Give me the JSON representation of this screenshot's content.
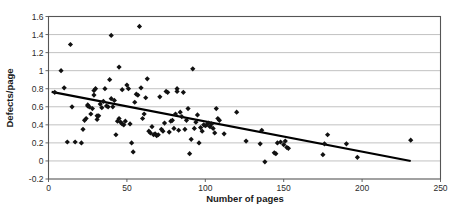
{
  "chart_data": {
    "type": "scatter",
    "title": "",
    "subtitle": "",
    "xlabel": "Number of pages",
    "ylabel": "Defects/page",
    "xlim": [
      0,
      250
    ],
    "ylim": [
      -0.2,
      1.6
    ],
    "xticks": [
      0,
      50,
      100,
      150,
      200,
      250
    ],
    "xtick_labels": [
      "0",
      "50",
      "100",
      "150",
      "200",
      "250"
    ],
    "yticks": [
      -0.2,
      0,
      0.2,
      0.4,
      0.6,
      0.8,
      1,
      1.2,
      1.4,
      1.6
    ],
    "ytick_labels": [
      "-0.2",
      "0",
      "0.2",
      "0.4",
      "0.6",
      "0.8",
      "1",
      "1.2",
      "1.4",
      "1.6"
    ],
    "grid": "horizontal",
    "legend": "none",
    "marker": "diamond",
    "marker_color": "#111111",
    "points": [
      [
        4,
        0.76
      ],
      [
        8,
        1.0
      ],
      [
        10,
        0.81
      ],
      [
        12,
        0.21
      ],
      [
        14,
        1.29
      ],
      [
        15,
        0.6
      ],
      [
        17,
        0.21
      ],
      [
        21,
        0.2
      ],
      [
        22,
        0.35
      ],
      [
        23,
        0.45
      ],
      [
        24,
        0.47
      ],
      [
        25,
        0.62
      ],
      [
        25,
        0.61
      ],
      [
        26,
        0.6
      ],
      [
        27,
        0.52
      ],
      [
        28,
        0.58
      ],
      [
        29,
        0.73
      ],
      [
        29,
        0.78
      ],
      [
        30,
        0.8
      ],
      [
        31,
        0.5
      ],
      [
        31,
        0.46
      ],
      [
        32,
        0.5
      ],
      [
        33,
        0.63
      ],
      [
        34,
        0.59
      ],
      [
        35,
        0.66
      ],
      [
        36,
        0.8
      ],
      [
        37,
        0.61
      ],
      [
        38,
        0.6
      ],
      [
        39,
        0.9
      ],
      [
        40,
        1.39
      ],
      [
        40,
        0.69
      ],
      [
        41,
        0.6
      ],
      [
        42,
        0.67
      ],
      [
        43,
        0.29
      ],
      [
        44,
        0.44
      ],
      [
        45,
        1.04
      ],
      [
        45,
        0.47
      ],
      [
        46,
        0.43
      ],
      [
        47,
        0.79
      ],
      [
        47,
        0.41
      ],
      [
        48,
        0.4
      ],
      [
        49,
        0.44
      ],
      [
        50,
        0.84
      ],
      [
        51,
        0.8
      ],
      [
        52,
        0.41
      ],
      [
        53,
        0.2
      ],
      [
        54,
        0.1
      ],
      [
        55,
        0.65
      ],
      [
        56,
        0.74
      ],
      [
        57,
        0.73
      ],
      [
        58,
        1.49
      ],
      [
        59,
        0.81
      ],
      [
        60,
        0.47
      ],
      [
        61,
        0.52
      ],
      [
        62,
        0.7
      ],
      [
        63,
        0.91
      ],
      [
        64,
        0.33
      ],
      [
        65,
        0.31
      ],
      [
        66,
        0.38
      ],
      [
        67,
        0.29
      ],
      [
        68,
        0.3
      ],
      [
        69,
        0.28
      ],
      [
        70,
        0.29
      ],
      [
        71,
        0.71
      ],
      [
        72,
        0.35
      ],
      [
        73,
        0.33
      ],
      [
        74,
        0.42
      ],
      [
        75,
        0.77
      ],
      [
        76,
        0.76
      ],
      [
        77,
        0.32
      ],
      [
        78,
        0.44
      ],
      [
        79,
        0.45
      ],
      [
        80,
        0.36
      ],
      [
        81,
        0.52
      ],
      [
        82,
        0.8
      ],
      [
        82,
        0.77
      ],
      [
        83,
        0.34
      ],
      [
        84,
        0.54
      ],
      [
        85,
        0.49
      ],
      [
        86,
        0.76
      ],
      [
        87,
        0.35
      ],
      [
        88,
        0.45
      ],
      [
        89,
        0.58
      ],
      [
        90,
        0.08
      ],
      [
        91,
        0.24
      ],
      [
        92,
        1.02
      ],
      [
        93,
        0.36
      ],
      [
        94,
        0.43
      ],
      [
        95,
        0.51
      ],
      [
        96,
        0.2
      ],
      [
        97,
        0.37
      ],
      [
        98,
        0.33
      ],
      [
        99,
        0.4
      ],
      [
        100,
        0.39
      ],
      [
        101,
        0.4
      ],
      [
        102,
        0.42
      ],
      [
        103,
        0.38
      ],
      [
        104,
        0.41
      ],
      [
        105,
        0.36
      ],
      [
        106,
        0.31
      ],
      [
        107,
        0.58
      ],
      [
        108,
        0.47
      ],
      [
        109,
        0.45
      ],
      [
        112,
        0.3
      ],
      [
        120,
        0.54
      ],
      [
        126,
        0.22
      ],
      [
        135,
        0.19
      ],
      [
        136,
        0.34
      ],
      [
        138,
        -0.01
      ],
      [
        144,
        0.09
      ],
      [
        145,
        0.08
      ],
      [
        146,
        0.2
      ],
      [
        148,
        0.21
      ],
      [
        150,
        0.18
      ],
      [
        151,
        0.22
      ],
      [
        152,
        0.15
      ],
      [
        153,
        0.14
      ],
      [
        175,
        0.07
      ],
      [
        176,
        0.19
      ],
      [
        178,
        0.29
      ],
      [
        190,
        0.19
      ],
      [
        197,
        0.04
      ],
      [
        231,
        0.23
      ]
    ],
    "trendline": {
      "type": "linear",
      "x_start": 2,
      "y_start": 0.765,
      "x_end": 231,
      "y_end": 0.0,
      "color": "#000000"
    }
  }
}
